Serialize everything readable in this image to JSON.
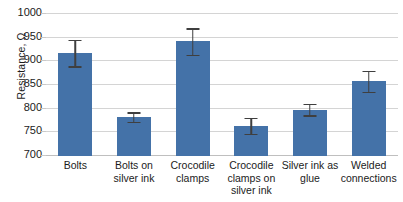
{
  "chart_data": {
    "type": "bar",
    "title": "",
    "xlabel": "",
    "ylabel": "Resistance, Ω",
    "ylim": [
      700,
      1000
    ],
    "ytick_step": 50,
    "ytick_labels": [
      "1000",
      "950",
      "900",
      "850",
      "800",
      "750",
      "700"
    ],
    "ytick_values": [
      1000,
      950,
      900,
      850,
      800,
      750,
      700
    ],
    "grid": true,
    "legend": false,
    "legend_position": "none",
    "bar_color": "#4472a8",
    "errorbar_color": "#3f3f3f",
    "gridline_color": "#d4d4d4",
    "categories": [
      "Bolts",
      "Bolts on silver ink",
      "Crocodile clamps",
      "Crocodile clamps on silver ink",
      "Silver ink as glue",
      "Welded connections"
    ],
    "values": [
      915,
      780,
      940,
      762,
      796,
      856
    ],
    "errors": [
      28,
      10,
      28,
      17,
      12,
      22
    ],
    "series": [
      {
        "name": "Resistance",
        "values": [
          915,
          780,
          940,
          762,
          796,
          856
        ],
        "errors": [
          28,
          10,
          28,
          17,
          12,
          22
        ]
      }
    ]
  }
}
